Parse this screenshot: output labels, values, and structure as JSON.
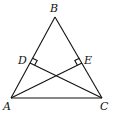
{
  "diagram": {
    "type": "geometry",
    "points": {
      "A": {
        "label": "A",
        "x": 11,
        "y": 98
      },
      "B": {
        "label": "B",
        "x": 55,
        "y": 17
      },
      "C": {
        "label": "C",
        "x": 102,
        "y": 98
      },
      "D": {
        "label": "D",
        "x": 30,
        "y": 63
      },
      "E": {
        "label": "E",
        "x": 82,
        "y": 63
      }
    },
    "segments": [
      "AB",
      "BC",
      "AC",
      "CD",
      "AE"
    ],
    "right_angles": [
      "D",
      "E"
    ],
    "stroke_color": "#111111"
  }
}
